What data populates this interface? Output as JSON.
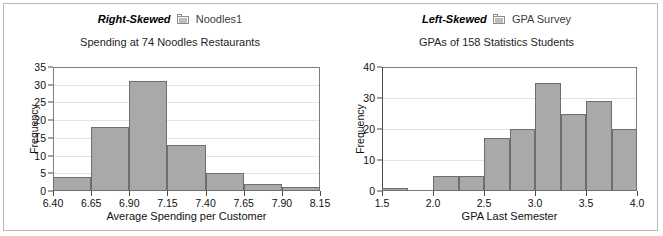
{
  "figure": {
    "border_color": "#b9b9b9",
    "background": "#ffffff"
  },
  "panels": [
    {
      "id": "left",
      "skew_label": "Right-Skewed",
      "icon": "worksheet-file-icon",
      "dataset_name": "Noodles1"
    },
    {
      "id": "right",
      "skew_label": "Left-Skewed",
      "icon": "worksheet-file-icon",
      "dataset_name": "GPA Survey"
    }
  ],
  "colors": {
    "bar_fill": "#a9a9a9",
    "bar_border": "#6e6e6e",
    "grid": "#e2e2e2",
    "axis": "#4a4a4a",
    "frame": "#7d7d7d"
  },
  "chart_data": [
    {
      "type": "bar",
      "subtype": "histogram",
      "title": "Spending at 74 Noodles Restaurants",
      "xlabel": "Average Spending per Customer",
      "ylabel": "Frequency",
      "xlim": [
        6.4,
        8.15
      ],
      "ylim": [
        0,
        35
      ],
      "xticks": [
        "6.40",
        "6.65",
        "6.90",
        "7.15",
        "7.40",
        "7.65",
        "7.90",
        "8.15"
      ],
      "xtick_values": [
        6.4,
        6.65,
        6.9,
        7.15,
        7.4,
        7.65,
        7.9,
        8.15
      ],
      "yticks": [
        "0",
        "5",
        "10",
        "15",
        "20",
        "25",
        "30",
        "35"
      ],
      "ytick_values": [
        0,
        5,
        10,
        15,
        20,
        25,
        30,
        35
      ],
      "grid": "horizontal",
      "legend": "none",
      "bin_width": 0.25,
      "bin_edges": [
        6.4,
        6.65,
        6.9,
        7.15,
        7.4,
        7.65,
        7.9,
        8.15
      ],
      "categories": [
        "6.40-6.65",
        "6.65-6.90",
        "6.90-7.15",
        "7.15-7.40",
        "7.40-7.65",
        "7.65-7.90",
        "7.90-8.15"
      ],
      "values": [
        4,
        18,
        31,
        13,
        5,
        2,
        1
      ],
      "total_n": 74
    },
    {
      "type": "bar",
      "subtype": "histogram",
      "title": "GPAs of 158 Statistics Students",
      "xlabel": "GPA Last Semester",
      "ylabel": "Frequency",
      "xlim": [
        1.5,
        4.0
      ],
      "ylim": [
        0,
        40
      ],
      "xticks": [
        "1.5",
        "2.0",
        "2.5",
        "3.0",
        "3.5",
        "4.0"
      ],
      "xtick_values": [
        1.5,
        2.0,
        2.5,
        3.0,
        3.5,
        4.0
      ],
      "yticks": [
        "0",
        "10",
        "20",
        "30",
        "40"
      ],
      "ytick_values": [
        0,
        10,
        20,
        30,
        40
      ],
      "grid": "horizontal",
      "legend": "none",
      "bin_width": 0.25,
      "bin_edges": [
        1.5,
        1.75,
        2.0,
        2.25,
        2.5,
        2.75,
        3.0,
        3.25,
        3.5,
        3.75,
        4.0
      ],
      "categories": [
        "1.50-1.75",
        "1.75-2.00",
        "2.00-2.25",
        "2.25-2.50",
        "2.50-2.75",
        "2.75-3.00",
        "3.00-3.25",
        "3.25-3.50",
        "3.50-3.75",
        "3.75-4.00"
      ],
      "values": [
        1,
        0,
        5,
        5,
        17,
        20,
        35,
        25,
        29,
        20
      ],
      "total_n": 158
    }
  ]
}
